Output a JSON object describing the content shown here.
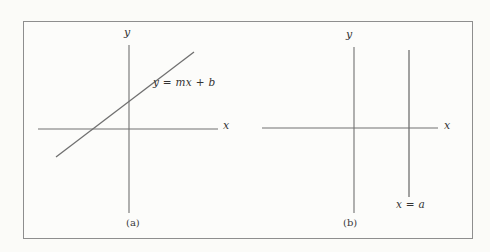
{
  "figure": {
    "background_color": "#fbfbf8",
    "frame_border_color": "#8e8e8e",
    "line_color": "#707070",
    "text_color": "#333333",
    "panels": [
      {
        "id": "a",
        "caption": "(a)",
        "y_axis_label": "y",
        "x_axis_label": "x",
        "curve_label": "y = mx + b"
      },
      {
        "id": "b",
        "caption": "(b)",
        "y_axis_label": "y",
        "x_axis_label": "x",
        "curve_label": "x = a"
      }
    ]
  }
}
